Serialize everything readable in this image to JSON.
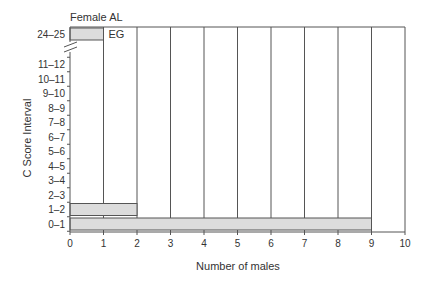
{
  "chart_data": {
    "type": "bar",
    "orientation": "horizontal",
    "title": "Female AL",
    "xlabel": "Number of males",
    "ylabel": "C Score Interval",
    "xlim": [
      0,
      10
    ],
    "x_ticks": [
      "0",
      "1",
      "2",
      "3",
      "4",
      "5",
      "6",
      "7",
      "8",
      "9",
      "10"
    ],
    "grid": "vertical",
    "axis_break": "between 11–12 and 24–25",
    "categories": [
      "0–1",
      "1–2",
      "2–3",
      "3–4",
      "4–5",
      "5–6",
      "6–7",
      "7–8",
      "8–9",
      "9–10",
      "10–11",
      "11–12",
      "24–25"
    ],
    "values": [
      9,
      2,
      0,
      0,
      0,
      0,
      0,
      0,
      0,
      0,
      0,
      0,
      1
    ],
    "annotations": [
      {
        "category": "24–25",
        "text": "EG"
      }
    ]
  }
}
